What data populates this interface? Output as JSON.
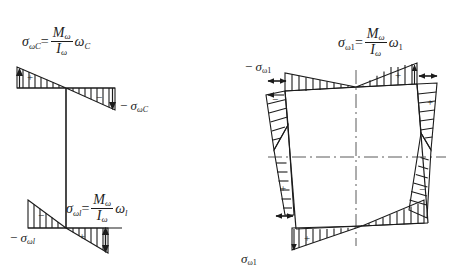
{
  "figure": {
    "ink_color": "#1c1c1c",
    "background": "#ffffff"
  },
  "left_diagram": {
    "name": "i-section-warping-stress",
    "section_type": "I-beam / T cross-section with web",
    "top_formula": {
      "lhs_sigma": "σ",
      "lhs_sub": "ωC",
      "equals": "=",
      "numerator_M": "M",
      "numerator_sub": "ω",
      "denominator_I": "I",
      "denominator_sub": "ω",
      "tail_omega": "ω",
      "tail_sub": "C",
      "plain": "σωC = (Mω / Iω) ωC"
    },
    "top_right_label": {
      "minus": "−",
      "sigma": "σ",
      "sub": "ωC",
      "plain": "− σωC"
    },
    "bottom_formula": {
      "lhs_sigma": "σ",
      "lhs_sub": "ωl",
      "equals": "=",
      "numerator_M": "M",
      "numerator_sub": "ω",
      "denominator_I": "I",
      "denominator_sub": "ω",
      "tail_omega": "ω",
      "tail_sub": "l",
      "plain": "σωl = (Mω / Iω) ωl"
    },
    "bottom_left_label": {
      "minus": "−",
      "sigma": "σ",
      "sub": "ωl",
      "plain": "− σωl"
    },
    "signs": {
      "top_left": "+",
      "top_right": "−",
      "bottom_left": "−",
      "bottom_right": "+"
    }
  },
  "right_diagram": {
    "name": "box-section-warping-stress",
    "section_type": "Closed box cross-section",
    "formula": {
      "lhs_sigma": "σ",
      "lhs_sub": "ω1",
      "equals": "=",
      "numerator_M": "M",
      "numerator_sub": "ω",
      "denominator_I": "I",
      "denominator_sub": "ω",
      "tail_omega": "ω",
      "tail_sub": "1",
      "plain": "σω1 = (Mω / Iω) ω1"
    },
    "top_left_label": {
      "minus": "−",
      "sigma": "σ",
      "sub": "ω1",
      "plain": "− σω1"
    },
    "bottom_left_label": {
      "sigma": "σ",
      "sub": "ω1",
      "plain": "σω1"
    },
    "signs": {
      "top_flange_left": "−",
      "top_flange_right": "+",
      "right_web_top": "+",
      "right_web_bottom": "−",
      "left_web_bottom": "+",
      "bottom_flange_left": "+"
    },
    "centerlines": {
      "vertical": "dash-dot",
      "horizontal": "dash-dot"
    }
  }
}
